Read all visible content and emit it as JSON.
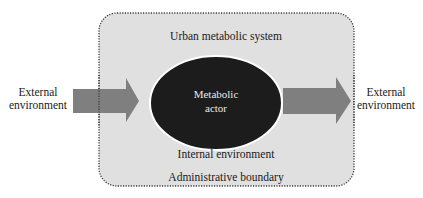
{
  "diagram": {
    "system_label": "Urban metabolic system",
    "actor_label_line1": "Metabolic",
    "actor_label_line2": "actor",
    "internal_label": "Internal environment",
    "boundary_label": "Administrative boundary",
    "left_external_line1": "External",
    "left_external_line2": "environment",
    "right_external_line1": "External",
    "right_external_line2": "environment"
  },
  "colors": {
    "system_fill": "#e0e0e0",
    "actor_fill": "#1c1c1c",
    "arrow_fill": "#7f7f7f",
    "text": "#1a1a1a"
  }
}
